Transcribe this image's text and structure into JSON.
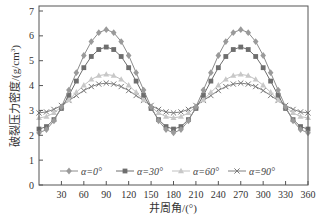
{
  "chart_data": {
    "type": "line",
    "title": "",
    "xlabel": "井周角/(°)",
    "ylabel": "破裂压力密度/(g/cm³)",
    "xlim": [
      0,
      360
    ],
    "ylim": [
      0,
      7
    ],
    "xticks": [
      30,
      60,
      90,
      120,
      150,
      180,
      210,
      240,
      270,
      300,
      330,
      360
    ],
    "yticks": [
      0,
      1,
      2,
      3,
      4,
      5,
      6,
      7
    ],
    "grid": false,
    "legend_position": "bottom-inside",
    "x": [
      0,
      10,
      20,
      30,
      40,
      50,
      60,
      70,
      80,
      90,
      100,
      110,
      120,
      130,
      140,
      150,
      160,
      170,
      180,
      190,
      200,
      210,
      220,
      230,
      240,
      250,
      260,
      270,
      280,
      290,
      300,
      310,
      320,
      330,
      340,
      350,
      360
    ],
    "series": [
      {
        "name": "α=0°",
        "marker": "diamond",
        "color": "#9a9a9a",
        "line_color": "#8c8c8c",
        "values": [
          2.1,
          2.23,
          2.58,
          3.14,
          3.82,
          4.52,
          5.21,
          5.77,
          6.13,
          6.25,
          6.13,
          5.77,
          5.21,
          4.52,
          3.82,
          3.14,
          2.58,
          2.23,
          2.1,
          2.23,
          2.58,
          3.14,
          3.82,
          4.52,
          5.21,
          5.77,
          6.13,
          6.25,
          6.13,
          5.77,
          5.21,
          4.52,
          3.82,
          3.14,
          2.58,
          2.23,
          2.1
        ]
      },
      {
        "name": "α=30°",
        "marker": "square",
        "color": "#6e6e6e",
        "line_color": "#6e6e6e",
        "values": [
          2.25,
          2.35,
          2.63,
          3.08,
          3.61,
          4.18,
          4.72,
          5.17,
          5.45,
          5.55,
          5.45,
          5.17,
          4.72,
          4.18,
          3.61,
          3.08,
          2.63,
          2.35,
          2.25,
          2.35,
          2.63,
          3.08,
          3.61,
          4.18,
          4.72,
          5.17,
          5.45,
          5.55,
          5.45,
          5.17,
          4.72,
          4.18,
          3.61,
          3.08,
          2.63,
          2.35,
          2.25
        ]
      },
      {
        "name": "α=60°",
        "marker": "triangle",
        "color": "#c8c8c8",
        "line_color": "#c0c0c0",
        "values": [
          2.7,
          2.75,
          2.9,
          3.14,
          3.42,
          3.73,
          4.01,
          4.25,
          4.4,
          4.45,
          4.4,
          4.25,
          4.01,
          3.73,
          3.42,
          3.14,
          2.9,
          2.75,
          2.7,
          2.75,
          2.9,
          3.14,
          3.42,
          3.73,
          4.01,
          4.25,
          4.4,
          4.45,
          4.4,
          4.25,
          4.01,
          3.73,
          3.42,
          3.14,
          2.9,
          2.75,
          2.7
        ]
      },
      {
        "name": "α=90°",
        "marker": "x",
        "color": "#7a7a7a",
        "line_color": "#808080",
        "values": [
          2.9,
          2.94,
          3.04,
          3.2,
          3.4,
          3.6,
          3.8,
          3.96,
          4.06,
          4.1,
          4.06,
          3.96,
          3.8,
          3.6,
          3.4,
          3.2,
          3.04,
          2.94,
          2.9,
          2.94,
          3.04,
          3.2,
          3.4,
          3.6,
          3.8,
          3.96,
          4.06,
          4.1,
          4.06,
          3.96,
          3.8,
          3.6,
          3.4,
          3.2,
          3.04,
          2.94,
          2.9
        ]
      }
    ]
  },
  "labels": {
    "xlabel": "井周角/(°)",
    "ylabel_main": "破裂压力密度/(g/cm",
    "ylabel_sup": "3",
    "ylabel_end": ")"
  }
}
